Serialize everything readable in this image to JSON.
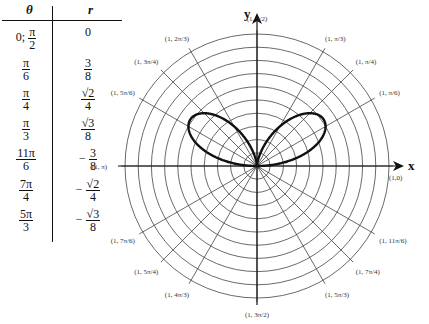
{
  "table": {
    "headers": {
      "theta": "θ",
      "r": "r"
    },
    "rows": [
      {
        "theta": {
          "prefix": "0; ",
          "num": "π",
          "den": "2"
        },
        "r": {
          "text": "0"
        }
      },
      {
        "theta": {
          "num": "π",
          "den": "6"
        },
        "r": {
          "num": "3",
          "den": "8"
        }
      },
      {
        "theta": {
          "num": "π",
          "den": "4"
        },
        "r": {
          "num": "√2",
          "den": "4"
        }
      },
      {
        "theta": {
          "num": "π",
          "den": "3"
        },
        "r": {
          "num": "√3",
          "den": "8"
        }
      },
      {
        "theta": {
          "num": "11π",
          "den": "6"
        },
        "r": {
          "sign": "−",
          "num": "3",
          "den": "8"
        }
      },
      {
        "theta": {
          "num": "7π",
          "den": "4"
        },
        "r": {
          "sign": "−",
          "num": "√2",
          "den": "4"
        }
      },
      {
        "theta": {
          "num": "5π",
          "den": "3"
        },
        "r": {
          "sign": "−",
          "num": "√3",
          "den": "8"
        }
      }
    ]
  },
  "plot": {
    "axis_x_label": "x",
    "axis_y_label": "y",
    "rings": 10,
    "curve": "r = sin θ cos² θ",
    "point_labels": [
      {
        "angle_deg": 90,
        "text": "(1, π/2)"
      },
      {
        "angle_deg": 60,
        "text": "(1, π/3)"
      },
      {
        "angle_deg": 45,
        "text": "(1, π/4)"
      },
      {
        "angle_deg": 30,
        "text": "(1, π/6)"
      },
      {
        "angle_deg": 0,
        "text": "(1,0)"
      },
      {
        "angle_deg": 330,
        "text": "(1, 11π/6)"
      },
      {
        "angle_deg": 315,
        "text": "(1, 7π/4)"
      },
      {
        "angle_deg": 300,
        "text": "(1, 5π/3)"
      },
      {
        "angle_deg": 270,
        "text": "(1, 3π/2)"
      },
      {
        "angle_deg": 240,
        "text": "(1, 4π/3)"
      },
      {
        "angle_deg": 225,
        "text": "(1, 5π/4)"
      },
      {
        "angle_deg": 210,
        "text": "(1, 7π/6)"
      },
      {
        "angle_deg": 180,
        "text": "(1, π)"
      },
      {
        "angle_deg": 150,
        "text": "(1, 5π/6)"
      },
      {
        "angle_deg": 135,
        "text": "(1, 3π/4)"
      },
      {
        "angle_deg": 120,
        "text": "(1, 2π/3)"
      }
    ]
  }
}
